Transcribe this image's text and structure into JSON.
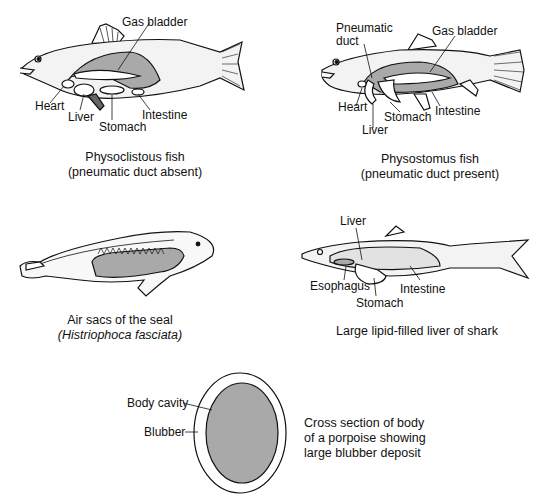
{
  "colors": {
    "background": "#ffffff",
    "ink": "#111111",
    "organ_fill": "#a9a9a9",
    "body_fill": "#f2f2f2"
  },
  "panels": [
    {
      "id": "physoclistous",
      "caption_line1": "Physoclistous fish",
      "caption_line2": "(pneumatic duct absent)",
      "labels": {
        "gas_bladder": "Gas bladder",
        "heart": "Heart",
        "liver": "Liver",
        "stomach": "Stomach",
        "intestine": "Intestine"
      }
    },
    {
      "id": "physostomus",
      "caption_line1": "Physostomus fish",
      "caption_line2": "(pneumatic duct present)",
      "labels": {
        "pneumatic_duct_1": "Pneumatic",
        "pneumatic_duct_2": "duct",
        "gas_bladder": "Gas bladder",
        "heart": "Heart",
        "liver": "Liver",
        "stomach": "Stomach",
        "intestine": "Intestine"
      }
    },
    {
      "id": "seal",
      "caption_line1": "Air sacs of the seal",
      "caption_line2": "(Histriophoca fasciata)"
    },
    {
      "id": "shark",
      "caption_line1": "Large lipid-filled liver of shark",
      "labels": {
        "liver": "Liver",
        "esophagus": "Esophagus",
        "stomach": "Stomach",
        "intestine": "Intestine"
      }
    },
    {
      "id": "porpoise",
      "caption_line1": "Cross section of body",
      "caption_line2": "of a porpoise showing",
      "caption_line3": "large blubber deposit",
      "labels": {
        "body_cavity": "Body cavity",
        "blubber": "Blubber"
      }
    }
  ]
}
